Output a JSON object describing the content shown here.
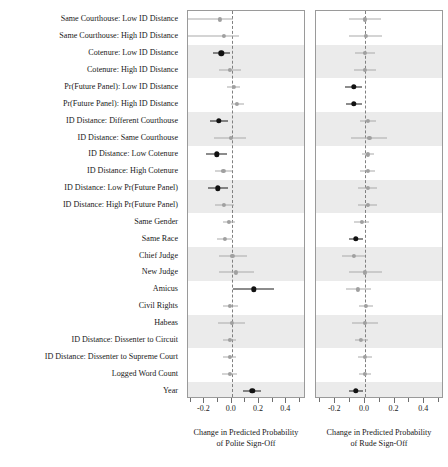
{
  "figure": {
    "kind": "coefficient-dot-whisker-plot",
    "panel_count": 2
  },
  "rows": [
    "Same Courthouse: Low ID Distance",
    "Same Courthouse: High ID Distance",
    "Cotenure: Low ID Distance",
    "Cotenure: High ID Distance",
    "Pr(Future Panel): Low ID Distance",
    "Pr(Future Panel): High ID Distance",
    "ID Distance: Different Courthouse",
    "ID Distance: Same Courthouse",
    "ID Distance: Low Cotenure",
    "ID Distance: High Cotenure",
    "ID Distance: Low Pr(Future Panel)",
    "ID Distance: High Pr(Future Panel)",
    "Same Gender",
    "Same Race",
    "Chief Judge",
    "New Judge",
    "Amicus",
    "Civil Rights",
    "Habeas",
    "ID Distance: Dissenter to Circuit",
    "ID Distance: Dissenter to Supreme Court",
    "Logged Word Count",
    "Year"
  ],
  "axis": {
    "tick_labels": [
      "-0.2",
      "0.0",
      "0.2",
      "0.4"
    ],
    "tick_values": [
      -0.2,
      0.0,
      0.2,
      0.4
    ],
    "minor_tick_values": [
      -0.3,
      -0.1,
      0.1,
      0.3,
      0.5
    ],
    "reference_line": 0.0
  },
  "panels": [
    {
      "id": "polite",
      "title_line1": "Change in Predicted Probability",
      "title_line2": "of Polite Sign-Off",
      "xlim": [
        -0.32,
        0.53
      ]
    },
    {
      "id": "rude",
      "title_line1": "Change in Predicted Probability",
      "title_line2": "of Rude Sign-Off",
      "xlim": [
        -0.33,
        0.52
      ]
    }
  ],
  "colors": {
    "significant": "#111111",
    "nonsignificant": "#a0a0a0",
    "stripe": "#ebebeb",
    "panel_border": "#9a9a9a",
    "reference_line": "#808080"
  },
  "chart_data": {
    "type": "scatter",
    "title": "",
    "xlabel": "Change in Predicted Probability",
    "ylabel": "",
    "grid": false,
    "legend": "none",
    "categories": [
      "Same Courthouse: Low ID Distance",
      "Same Courthouse: High ID Distance",
      "Cotenure: Low ID Distance",
      "Cotenure: High ID Distance",
      "Pr(Future Panel): Low ID Distance",
      "Pr(Future Panel): High ID Distance",
      "ID Distance: Different Courthouse",
      "ID Distance: Same Courthouse",
      "ID Distance: Low Cotenure",
      "ID Distance: High Cotenure",
      "ID Distance: Low Pr(Future Panel)",
      "ID Distance: High Pr(Future Panel)",
      "Same Gender",
      "Same Race",
      "Chief Judge",
      "New Judge",
      "Amicus",
      "Civil Rights",
      "Habeas",
      "ID Distance: Dissenter to Circuit",
      "ID Distance: Dissenter to Supreme Court",
      "Logged Word Count",
      "Year"
    ],
    "series": [
      {
        "name": "Change in Predicted Probability of Polite Sign-Off",
        "panel": "polite",
        "xlim": [
          -0.32,
          0.53
        ],
        "points": [
          {
            "category": "Same Courthouse: Low ID Distance",
            "estimate": -0.085,
            "low": -0.32,
            "high": 0.01,
            "significant": false
          },
          {
            "category": "Same Courthouse: High ID Distance",
            "estimate": -0.055,
            "low": -0.32,
            "high": 0.055,
            "significant": false
          },
          {
            "category": "Cotenure: Low ID Distance",
            "estimate": -0.075,
            "low": -0.135,
            "high": -0.015,
            "significant": true
          },
          {
            "category": "Cotenure: High ID Distance",
            "estimate": -0.01,
            "low": -0.095,
            "high": 0.065,
            "significant": false
          },
          {
            "category": "Pr(Future Panel): Low ID Distance",
            "estimate": 0.015,
            "low": -0.035,
            "high": 0.06,
            "significant": false
          },
          {
            "category": "Pr(Future Panel): High ID Distance",
            "estimate": 0.04,
            "low": -0.008,
            "high": 0.09,
            "significant": false
          },
          {
            "category": "ID Distance: Different Courthouse",
            "estimate": -0.095,
            "low": -0.16,
            "high": -0.03,
            "significant": true
          },
          {
            "category": "ID Distance: Same Courthouse",
            "estimate": -0.005,
            "low": -0.13,
            "high": 0.105,
            "significant": false
          },
          {
            "category": "ID Distance: Low Cotenure",
            "estimate": -0.11,
            "low": -0.185,
            "high": -0.035,
            "significant": true
          },
          {
            "category": "ID Distance: High Cotenure",
            "estimate": -0.06,
            "low": -0.125,
            "high": 0.005,
            "significant": false
          },
          {
            "category": "ID Distance: Low Pr(Future Panel)",
            "estimate": -0.1,
            "low": -0.175,
            "high": -0.03,
            "significant": true
          },
          {
            "category": "ID Distance: High Pr(Future Panel)",
            "estimate": -0.055,
            "low": -0.125,
            "high": 0.015,
            "significant": false
          },
          {
            "category": "Same Gender",
            "estimate": -0.02,
            "low": -0.065,
            "high": 0.025,
            "significant": false
          },
          {
            "category": "Same Race",
            "estimate": -0.05,
            "low": -0.105,
            "high": 0.005,
            "significant": false
          },
          {
            "category": "Chief Judge",
            "estimate": 0.005,
            "low": -0.095,
            "high": 0.11,
            "significant": false
          },
          {
            "category": "New Judge",
            "estimate": 0.03,
            "low": -0.095,
            "high": 0.16,
            "significant": false
          },
          {
            "category": "Amicus",
            "estimate": 0.16,
            "low": 0.01,
            "high": 0.31,
            "significant": true
          },
          {
            "category": "Civil Rights",
            "estimate": -0.01,
            "low": -0.065,
            "high": 0.045,
            "significant": false
          },
          {
            "category": "Habeas",
            "estimate": 0.0,
            "low": -0.1,
            "high": 0.1,
            "significant": false
          },
          {
            "category": "ID Distance: Dissenter to Circuit",
            "estimate": -0.015,
            "low": -0.06,
            "high": 0.03,
            "significant": false
          },
          {
            "category": "ID Distance: Dissenter to Supreme Court",
            "estimate": -0.015,
            "low": -0.06,
            "high": 0.03,
            "significant": false
          },
          {
            "category": "Logged Word Count",
            "estimate": -0.015,
            "low": -0.07,
            "high": 0.04,
            "significant": false
          },
          {
            "category": "Year",
            "estimate": 0.15,
            "low": 0.085,
            "high": 0.215,
            "significant": true
          }
        ]
      },
      {
        "name": "Change in Predicted Probability of Rude Sign-Off",
        "panel": "rude",
        "xlim": [
          -0.33,
          0.52
        ],
        "points": [
          {
            "category": "Same Courthouse: Low ID Distance",
            "estimate": 0.0,
            "low": -0.11,
            "high": 0.11,
            "significant": false
          },
          {
            "category": "Same Courthouse: High ID Distance",
            "estimate": 0.005,
            "low": -0.105,
            "high": 0.115,
            "significant": false
          },
          {
            "category": "Cotenure: Low ID Distance",
            "estimate": 0.0,
            "low": -0.07,
            "high": 0.07,
            "significant": false
          },
          {
            "category": "Cotenure: High ID Distance",
            "estimate": 0.0,
            "low": -0.075,
            "high": 0.075,
            "significant": false
          },
          {
            "category": "Pr(Future Panel): Low ID Distance",
            "estimate": -0.075,
            "low": -0.135,
            "high": -0.02,
            "significant": true
          },
          {
            "category": "Pr(Future Panel): High ID Distance",
            "estimate": -0.075,
            "low": -0.13,
            "high": -0.02,
            "significant": true
          },
          {
            "category": "ID Distance: Different Courthouse",
            "estimate": 0.02,
            "low": -0.035,
            "high": 0.075,
            "significant": false
          },
          {
            "category": "ID Distance: Same Courthouse",
            "estimate": 0.03,
            "low": -0.095,
            "high": 0.15,
            "significant": false
          },
          {
            "category": "ID Distance: Low Cotenure",
            "estimate": 0.018,
            "low": -0.02,
            "high": 0.06,
            "significant": false
          },
          {
            "category": "ID Distance: High Cotenure",
            "estimate": 0.018,
            "low": -0.03,
            "high": 0.065,
            "significant": false
          },
          {
            "category": "ID Distance: Low Pr(Future Panel)",
            "estimate": 0.018,
            "low": -0.045,
            "high": 0.08,
            "significant": false
          },
          {
            "category": "ID Distance: High Pr(Future Panel)",
            "estimate": 0.018,
            "low": -0.045,
            "high": 0.08,
            "significant": false
          },
          {
            "category": "Same Gender",
            "estimate": -0.02,
            "low": -0.075,
            "high": 0.03,
            "significant": false
          },
          {
            "category": "Same Race",
            "estimate": -0.06,
            "low": -0.11,
            "high": -0.01,
            "significant": true
          },
          {
            "category": "Chief Judge",
            "estimate": -0.075,
            "low": -0.155,
            "high": 0.0,
            "significant": false
          },
          {
            "category": "New Judge",
            "estimate": 0.0,
            "low": -0.11,
            "high": 0.115,
            "significant": false
          },
          {
            "category": "Amicus",
            "estimate": -0.045,
            "low": -0.13,
            "high": 0.04,
            "significant": false
          },
          {
            "category": "Civil Rights",
            "estimate": 0.008,
            "low": -0.04,
            "high": 0.055,
            "significant": false
          },
          {
            "category": "Habeas",
            "estimate": 0.0,
            "low": -0.09,
            "high": 0.09,
            "significant": false
          },
          {
            "category": "ID Distance: Dissenter to Circuit",
            "estimate": -0.025,
            "low": -0.07,
            "high": 0.02,
            "significant": false
          },
          {
            "category": "ID Distance: Dissenter to Supreme Court",
            "estimate": 0.0,
            "low": -0.045,
            "high": 0.045,
            "significant": false
          },
          {
            "category": "Logged Word Count",
            "estimate": 0.0,
            "low": -0.04,
            "high": 0.04,
            "significant": false
          },
          {
            "category": "Year",
            "estimate": -0.06,
            "low": -0.11,
            "high": -0.01,
            "significant": true
          }
        ]
      }
    ]
  }
}
